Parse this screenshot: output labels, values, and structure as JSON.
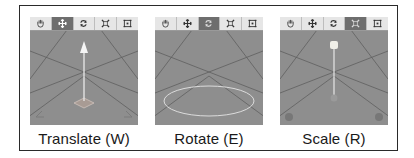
{
  "panels": [
    {
      "id": "translate",
      "label": "Translate (W)",
      "active_tool": "move",
      "tools": [
        {
          "icon": "hand-icon",
          "name": "hand"
        },
        {
          "icon": "move-icon",
          "name": "move"
        },
        {
          "icon": "rotate-icon",
          "name": "rotate"
        },
        {
          "icon": "scale-icon",
          "name": "scale"
        },
        {
          "icon": "rect-icon",
          "name": "rect"
        }
      ],
      "gizmo": "translate-arrow"
    },
    {
      "id": "rotate",
      "label": "Rotate (E)",
      "active_tool": "rotate",
      "gizmo": "rotate-ring"
    },
    {
      "id": "scale",
      "label": "Scale (R)",
      "active_tool": "scale",
      "gizmo": "scale-handle"
    }
  ],
  "colors": {
    "toolbar_bg": "#e6e6e6",
    "active_tool_bg": "#6e6e6e",
    "viewport_bg": "#8e8e8e",
    "grid_line": "#5a5a5a",
    "gizmo": "#f2f2f2"
  }
}
